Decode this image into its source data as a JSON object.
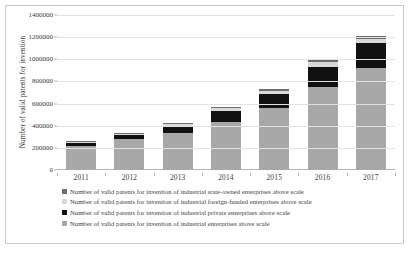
{
  "chart_data": {
    "type": "bar",
    "title": "",
    "xlabel": "",
    "ylabel": "Number of valid patents for invention",
    "categories": [
      "2011",
      "2012",
      "2013",
      "2014",
      "2015",
      "2016",
      "2017"
    ],
    "ylim": [
      0,
      1400000
    ],
    "yticks": [
      0,
      200000,
      400000,
      600000,
      800000,
      1000000,
      1200000,
      1400000
    ],
    "ytick_labels": [
      "0",
      "200000",
      "400000",
      "600000",
      "800000",
      "1000000",
      "1200000",
      "1400000"
    ],
    "grid": true,
    "stacked": true,
    "legend_position": "bottom",
    "series": [
      {
        "name": "Number of valid patents for invention of industrial enterprises above scale",
        "key": "base",
        "color": "#a8a8a8",
        "values": [
          215000,
          277000,
          338000,
          437000,
          557000,
          748000,
          917000
        ]
      },
      {
        "name": "Number of valid patents for invention of industrial private enterprises above scale",
        "key": "private",
        "color": "#111111",
        "values": [
          33000,
          40000,
          55000,
          95000,
          128000,
          184000,
          233000
        ]
      },
      {
        "name": "Number of valid patents for invention of industrial foreign-funded enterprises above scale",
        "key": "foreign",
        "color": "#d9d9d9",
        "values": [
          9000,
          12000,
          19000,
          26000,
          32000,
          40000,
          36000
        ]
      },
      {
        "name": "Number of valid patents for invention of industrial state-owned enterprises above scale",
        "key": "state",
        "color": "#6e6e6e",
        "values": [
          6000,
          8000,
          11000,
          14000,
          17000,
          21000,
          22000
        ]
      }
    ]
  },
  "legend": {
    "items": [
      {
        "label": "Number of valid patents for invention of industrial state-owned enterprises above scale",
        "marker": "state"
      },
      {
        "label": "Number of valid patents for invention of industrial foreign-funded enterprises above scale",
        "marker": "foreign"
      },
      {
        "label": "Number of valid patents for invention of industrial private enterprises above scale",
        "marker": "private"
      },
      {
        "label": "Number of valid patents for invention of industrial enterprises above scale",
        "marker": "base"
      }
    ]
  }
}
